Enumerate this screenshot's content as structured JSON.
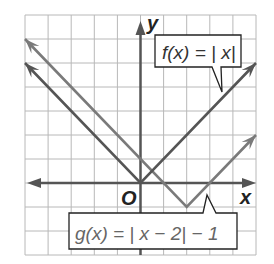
{
  "chart_data": {
    "type": "line",
    "title": "",
    "xlabel": "x",
    "ylabel": "y",
    "origin_label": "O",
    "xlim": [
      -5,
      5
    ],
    "ylim": [
      -3,
      7
    ],
    "grid": true,
    "grid_step": 1,
    "series": [
      {
        "name": "f(x) = |x|",
        "label": "f(x) = | x|",
        "x": [
          -5,
          0,
          5
        ],
        "y": [
          5,
          0,
          5
        ],
        "vertex": [
          0,
          0
        ],
        "color": "#555555"
      },
      {
        "name": "g(x) = |x - 2| - 1",
        "label": "g(x) = | x − 2|  − 1",
        "x": [
          -5,
          2,
          5
        ],
        "y": [
          6,
          -1,
          2
        ],
        "vertex": [
          2,
          -1
        ],
        "color": "#7a7a7a"
      }
    ]
  },
  "colors": {
    "grid": "#b8b8b8",
    "axis": "#555555",
    "f_line": "#555555",
    "g_line": "#7a7a7a",
    "callout_border": "#222222"
  }
}
